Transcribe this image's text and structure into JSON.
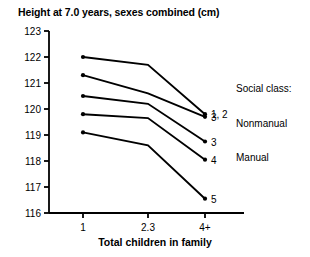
{
  "chart_data": {
    "type": "line",
    "title": "Height at 7.0 years, sexes combined (cm)",
    "xlabel": "Total children in family",
    "ylabel": "",
    "categories": [
      "1",
      "2.3",
      "4+"
    ],
    "ylim": [
      116,
      123
    ],
    "yticks": [
      116,
      117,
      118,
      119,
      120,
      121,
      122,
      123
    ],
    "ytick_labels": [
      "116",
      "117",
      "118",
      "119",
      "120",
      "121",
      "122",
      "123"
    ],
    "grid": false,
    "legend_position": "right",
    "series": [
      {
        "name": "1, 2",
        "label": "1, 2",
        "group": "Nonmanual",
        "values": [
          122.0,
          121.7,
          119.8
        ]
      },
      {
        "name": "3 Nonmanual",
        "label": "3",
        "group": "Nonmanual",
        "values": [
          121.3,
          120.6,
          119.7
        ]
      },
      {
        "name": "3 Manual",
        "label": "3",
        "group": "Manual",
        "values": [
          120.5,
          120.2,
          118.75
        ]
      },
      {
        "name": "4",
        "label": "4",
        "group": "Manual",
        "values": [
          119.8,
          119.65,
          118.05
        ]
      },
      {
        "name": "5",
        "label": "5",
        "group": "Manual",
        "values": [
          119.1,
          118.6,
          116.55
        ]
      }
    ],
    "annotations": [
      {
        "text": "Social class:",
        "role": "legend-title"
      },
      {
        "text": "Nonmanual",
        "role": "legend-group"
      },
      {
        "text": "Manual",
        "role": "legend-group"
      }
    ]
  },
  "legend": {
    "title": "Social class:",
    "groups": [
      "Nonmanual",
      "Manual"
    ]
  },
  "colors": {
    "line": "#000000",
    "axis": "#000000",
    "background": "#ffffff",
    "text": "#000000"
  }
}
